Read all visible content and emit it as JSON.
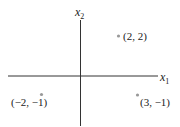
{
  "axes": {
    "x_label": "x",
    "x_sub": "1",
    "y_label": "x",
    "y_sub": "2"
  },
  "points": [
    {
      "label": "(2, 2)",
      "x": 2,
      "y": 2
    },
    {
      "label": "(−2, −1)",
      "x": -2,
      "y": -1
    },
    {
      "label": "(3, −1)",
      "x": 3,
      "y": -1
    }
  ],
  "colors": {
    "axis": "#333333",
    "point": "#999999",
    "text": "#222222"
  }
}
